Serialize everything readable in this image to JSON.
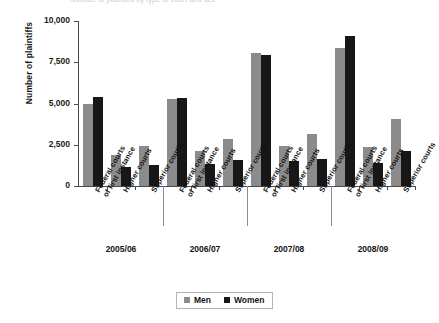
{
  "figure": {
    "clipped_title": "Number of plaintiffs by type of court and sex",
    "y_axis_title": "Number of plaintiffs"
  },
  "legend": {
    "position": "bottom-center",
    "items": [
      {
        "label": "Men",
        "color": "#8b8b8b"
      },
      {
        "label": "Women",
        "color": "#171717"
      }
    ]
  },
  "axis": {
    "yticks": [
      "0",
      "2,500",
      "5,000",
      "7,500",
      "10,000"
    ]
  },
  "categories": [
    {
      "line1": "Federal courts",
      "line2": "of first instance"
    },
    {
      "line1": "Higher courts",
      "line2": ""
    },
    {
      "line1": "Superior courts",
      "line2": ""
    }
  ],
  "years": [
    "2005/06",
    "2006/07",
    "2007/08",
    "2008/09"
  ],
  "chart_data": {
    "type": "bar",
    "title": "Number of plaintiffs by type of court and sex",
    "xlabel": "",
    "ylabel": "Number of plaintiffs",
    "ylim": [
      0,
      10000
    ],
    "yticks": [
      0,
      2500,
      5000,
      7500,
      10000
    ],
    "grid": false,
    "legend_position": "bottom-center",
    "group_labels": [
      "2005/06",
      "2006/07",
      "2007/08",
      "2008/09"
    ],
    "categories": [
      "Federal courts of first instance",
      "Higher courts",
      "Superior courts",
      "Federal courts of first instance",
      "Higher courts",
      "Superior courts",
      "Federal courts of first instance",
      "Higher courts",
      "Superior courts",
      "Federal courts of first instance",
      "Higher courts",
      "Superior courts"
    ],
    "series": [
      {
        "name": "Men",
        "color": "#8b8b8b",
        "values": [
          5000,
          1900,
          2450,
          5250,
          2150,
          2850,
          8050,
          2450,
          3150,
          8350,
          2350,
          4050
        ]
      },
      {
        "name": "Women",
        "color": "#171717",
        "values": [
          5400,
          1150,
          1250,
          5350,
          1350,
          1600,
          7950,
          1500,
          1650,
          9100,
          1400,
          2100
        ]
      }
    ]
  }
}
